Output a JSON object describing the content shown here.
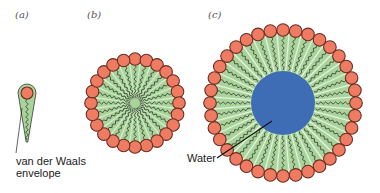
{
  "panels": [
    {
      "id": "a",
      "label": "(a)",
      "x": 15,
      "y": 9
    },
    {
      "id": "b",
      "label": "(b)",
      "x": 87,
      "y": 9
    },
    {
      "id": "c",
      "label": "(c)",
      "x": 208,
      "y": 9
    }
  ],
  "annotations": {
    "vdw_line1": "van der Waals",
    "vdw_line2": "envelope",
    "water": "Water"
  },
  "colors": {
    "tail_fill": "#a9d39a",
    "tail_stroke": "#5c7f54",
    "head_fill": "#ef7b63",
    "head_stroke": "#6b2e22",
    "chain": "#1f2a1c",
    "water": "#3f6db5"
  },
  "micelle_b": {
    "cx": 135,
    "cy": 103,
    "head_radius_pos": 44,
    "head_r": 6.3,
    "count": 24,
    "core_r": 0
  },
  "micelle_c": {
    "cx": 283,
    "cy": 103,
    "head_radius_pos": 73,
    "head_r": 6.3,
    "count": 36,
    "core_r": 32
  },
  "single": {
    "cx": 27,
    "head_cy": 93,
    "tip_y": 142
  }
}
